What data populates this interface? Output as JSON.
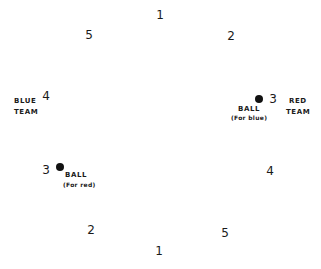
{
  "diagram": {
    "positions": [
      {
        "id": "top-1",
        "label": "1",
        "x": 160,
        "y": 15
      },
      {
        "id": "top-left-5",
        "label": "5",
        "x": 89,
        "y": 35
      },
      {
        "id": "top-right-2",
        "label": "2",
        "x": 231,
        "y": 36
      },
      {
        "id": "left-4",
        "label": "4",
        "x": 46,
        "y": 96
      },
      {
        "id": "right-3",
        "label": "3",
        "x": 273,
        "y": 99
      },
      {
        "id": "left-3",
        "label": "3",
        "x": 46,
        "y": 170
      },
      {
        "id": "right-4",
        "label": "4",
        "x": 270,
        "y": 171
      },
      {
        "id": "bottom-left-2",
        "label": "2",
        "x": 91,
        "y": 230
      },
      {
        "id": "bottom-right-5",
        "label": "5",
        "x": 225,
        "y": 233
      },
      {
        "id": "bottom-1",
        "label": "1",
        "x": 159,
        "y": 251
      }
    ],
    "teams": {
      "blue": {
        "line1": "BLUE",
        "line2": "TEAM"
      },
      "red": {
        "line1": "RED",
        "line2": "TEAM"
      }
    },
    "balls": {
      "blue": {
        "label": "BALL",
        "note": "(For blue)"
      },
      "red": {
        "label": "BALL",
        "note": "(For red)"
      }
    }
  }
}
